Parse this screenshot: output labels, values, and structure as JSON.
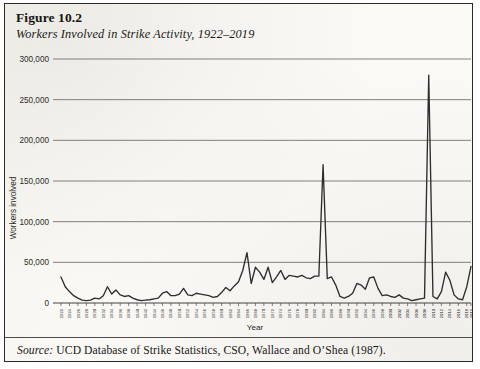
{
  "figure": {
    "number": "Figure 10.2",
    "title": "Workers Involved in Strike Activity, 1922–2019",
    "source_word": "Source:",
    "source_text": " UCD Database of Strike Statistics, CSO, Wallace and O’Shea (1987)."
  },
  "chart_data": {
    "type": "line",
    "title": "Workers Involved in Strike Activity, 1922–2019",
    "xlabel": "Year",
    "ylabel": "Workers involved",
    "ylim": [
      0,
      300000
    ],
    "xlim": [
      1922,
      2019
    ],
    "ytick_labels": [
      "0",
      "50,000",
      "100,000",
      "150,000",
      "200,000",
      "250,000",
      "300,000"
    ],
    "ytick_values": [
      0,
      50000,
      100000,
      150000,
      200000,
      250000,
      300000
    ],
    "grid": "horizontal",
    "legend": "none",
    "line_color": "#2f2e2c",
    "xtick_step": 2,
    "xtick_labels": [
      "1922",
      "1924",
      "1926",
      "1928",
      "1930",
      "1932",
      "1934",
      "1936",
      "1938",
      "1940",
      "1942",
      "1944",
      "1946",
      "1948",
      "1950",
      "1952",
      "1954",
      "1956",
      "1958",
      "1960",
      "1962",
      "1964",
      "1966",
      "1968",
      "1970",
      "1972",
      "1974",
      "1976",
      "1978",
      "1980",
      "1982",
      "1984",
      "1986",
      "1988",
      "1990",
      "1992",
      "1994",
      "1996",
      "1998",
      "2000",
      "2002",
      "2004",
      "2006",
      "2008",
      "2010",
      "2012",
      "2014",
      "2016",
      "2018",
      "2019"
    ],
    "x": [
      1922,
      1923,
      1924,
      1925,
      1926,
      1927,
      1928,
      1929,
      1930,
      1931,
      1932,
      1933,
      1934,
      1935,
      1936,
      1937,
      1938,
      1939,
      1940,
      1941,
      1942,
      1943,
      1944,
      1945,
      1946,
      1947,
      1948,
      1949,
      1950,
      1951,
      1952,
      1953,
      1954,
      1955,
      1956,
      1957,
      1958,
      1959,
      1960,
      1961,
      1962,
      1963,
      1964,
      1965,
      1966,
      1967,
      1968,
      1969,
      1970,
      1971,
      1972,
      1973,
      1974,
      1975,
      1976,
      1977,
      1978,
      1979,
      1980,
      1981,
      1982,
      1983,
      1984,
      1985,
      1986,
      1987,
      1988,
      1989,
      1990,
      1991,
      1992,
      1993,
      1994,
      1995,
      1996,
      1997,
      1998,
      1999,
      2000,
      2001,
      2002,
      2003,
      2004,
      2005,
      2006,
      2007,
      2008,
      2009,
      2010,
      2011,
      2012,
      2013,
      2014,
      2015,
      2016,
      2017,
      2018,
      2019
    ],
    "values": [
      32000,
      20000,
      14000,
      9000,
      6000,
      3500,
      3000,
      3500,
      6000,
      5000,
      9000,
      20000,
      11000,
      16000,
      10000,
      8000,
      9000,
      6000,
      4000,
      3000,
      3500,
      4000,
      5000,
      6000,
      12000,
      14000,
      9000,
      9000,
      11000,
      18000,
      10000,
      9000,
      12000,
      11000,
      10000,
      9000,
      7000,
      8000,
      13000,
      19000,
      15000,
      21000,
      26000,
      40000,
      62000,
      24000,
      44000,
      38000,
      29000,
      44000,
      25000,
      32000,
      40000,
      29000,
      34000,
      33000,
      32000,
      34000,
      31000,
      30000,
      33000,
      33000,
      170000,
      30000,
      32000,
      22000,
      8000,
      6000,
      8000,
      12000,
      24000,
      22000,
      17000,
      31000,
      32000,
      18000,
      9000,
      10000,
      8000,
      7000,
      10000,
      6000,
      5000,
      3000,
      4000,
      5000,
      6000,
      280000,
      8000,
      5000,
      14000,
      38000,
      28000,
      10000,
      5000,
      4000,
      20000,
      45000
    ],
    "annotations": [
      {
        "label": "peak 1966",
        "year": 1966,
        "value": 62000
      },
      {
        "label": "peak 1984",
        "year": 1984,
        "value": 170000
      },
      {
        "label": "peak 2009",
        "year": 2009,
        "value": 280000
      }
    ]
  }
}
